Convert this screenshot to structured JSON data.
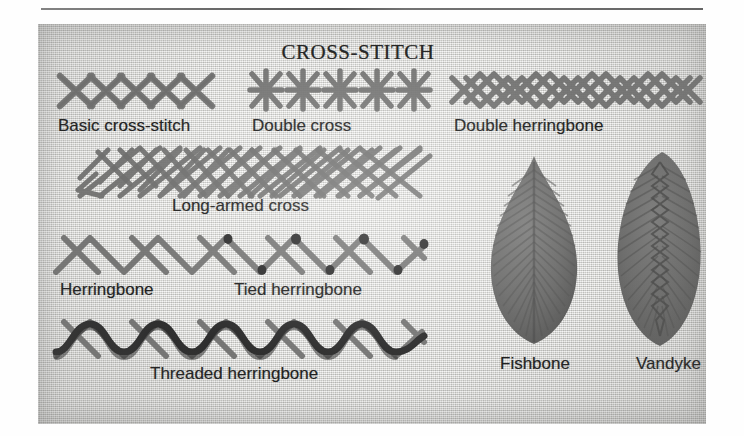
{
  "page": {
    "title": "CROSS-STITCH",
    "rule_color": "#4a4a4a",
    "plate_bg_color": "#d8d8d4",
    "thread_color": "#6f6f6e",
    "dark_thread_color": "#2e2e2e",
    "label_color": "#1f1f1f"
  },
  "samples": [
    {
      "id": "basic-cross-stitch",
      "label": "Basic cross-stitch",
      "row": 1,
      "column": "left"
    },
    {
      "id": "double-cross",
      "label": "Double cross",
      "row": 1,
      "column": "center"
    },
    {
      "id": "double-herringbone",
      "label": "Double herringbone",
      "row": 1,
      "column": "right"
    },
    {
      "id": "long-armed-cross",
      "label": "Long-armed cross",
      "row": 2,
      "column": "left"
    },
    {
      "id": "herringbone",
      "label": "Herringbone",
      "row": 3,
      "column": "left"
    },
    {
      "id": "tied-herringbone",
      "label": "Tied herringbone",
      "row": 3,
      "column": "center"
    },
    {
      "id": "threaded-herringbone",
      "label": "Threaded herringbone",
      "row": 4,
      "column": "left"
    },
    {
      "id": "fishbone",
      "label": "Fishbone",
      "row": 3,
      "column": "right"
    },
    {
      "id": "vandyke",
      "label": "Vandyke",
      "row": 3,
      "column": "right"
    }
  ],
  "labels": {
    "basic_cross_stitch": "Basic cross-stitch",
    "double_cross": "Double cross",
    "double_herringbone": "Double herringbone",
    "long_armed_cross": "Long-armed cross",
    "herringbone": "Herringbone",
    "tied_herringbone": "Tied herringbone",
    "threaded_herringbone": "Threaded herringbone",
    "fishbone": "Fishbone",
    "vandyke": "Vandyke"
  }
}
